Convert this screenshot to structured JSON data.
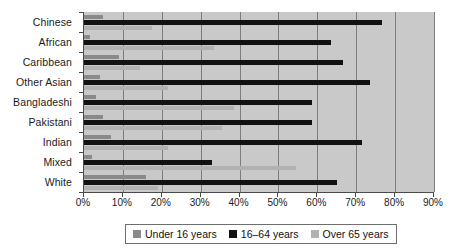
{
  "chart_data": {
    "type": "bar",
    "orientation": "horizontal",
    "title": "",
    "xlabel": "",
    "ylabel": "",
    "xlim": [
      0,
      90
    ],
    "xtick_labels": [
      "0%",
      "10%",
      "20%",
      "30%",
      "40%",
      "50%",
      "60%",
      "70%",
      "80%",
      "90%"
    ],
    "xtick_values": [
      0,
      10,
      20,
      30,
      40,
      50,
      60,
      70,
      80,
      90
    ],
    "grid": true,
    "legend_position": "bottom",
    "categories": [
      "Chinese",
      "African",
      "Caribbean",
      "Other Asian",
      "Bangladeshi",
      "Pakistani",
      "Indian",
      "Mixed",
      "White"
    ],
    "series": [
      {
        "name": "Under 16 years",
        "color": "#8a8a8a",
        "values": [
          5,
          1.5,
          9,
          4,
          3,
          5,
          7,
          2,
          16
        ]
      },
      {
        "name": "16–64 years",
        "color": "#111111",
        "values": [
          76.5,
          63.5,
          66.5,
          73.5,
          58.5,
          58.5,
          71.5,
          33,
          65
        ]
      },
      {
        "name": "Over 65 years",
        "color": "#b2b2b2",
        "values": [
          17.5,
          33.5,
          14.5,
          21.5,
          38.5,
          35.5,
          21.5,
          54.5,
          19
        ]
      }
    ]
  },
  "legend": {
    "items": [
      {
        "label": "Under 16 years"
      },
      {
        "label": "16–64 years"
      },
      {
        "label": "Over 65 years"
      }
    ]
  },
  "colors": {
    "plot_background": "#c9c9c9",
    "gridline": "#7d7d7d",
    "axis": "#4a4a4a",
    "under16": "#8a8a8a",
    "age16to64": "#111111",
    "over65": "#b2b2b2"
  }
}
